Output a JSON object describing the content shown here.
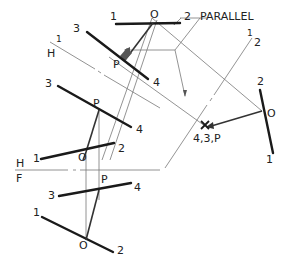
{
  "diagram": {
    "labels": {
      "parallel": "PARALLEL",
      "one": "1",
      "two": "2",
      "three": "3",
      "four": "4",
      "o": "O",
      "p": "P",
      "h": "H",
      "f": "F",
      "one_half_num": "1",
      "one_half_den": "2",
      "point_view": "4,3,P"
    },
    "colors": {
      "ink": "#1a1a1a",
      "construction": "#777777",
      "perpendicular_mark": "#555555",
      "background": "#ffffff"
    },
    "views": [
      {
        "name": "front-view",
        "fold_line": "H/F"
      },
      {
        "name": "horizontal-view",
        "fold_line": "H/1"
      },
      {
        "name": "auxiliary-view-1",
        "fold_line": "1/2"
      },
      {
        "name": "auxiliary-view-2",
        "note": "line 3-4 appears as point 4,3,P"
      }
    ]
  }
}
